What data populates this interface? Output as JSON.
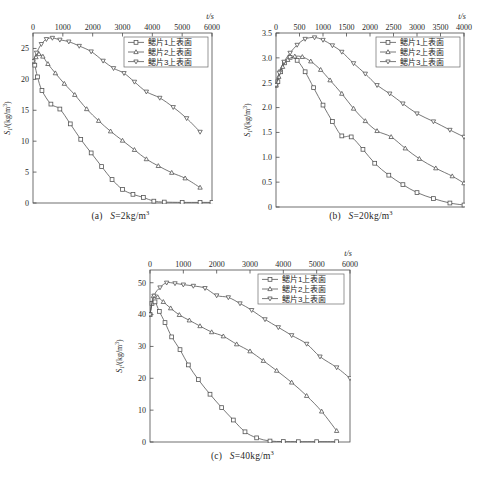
{
  "figure": {
    "series_names": [
      "鳃片1上表面",
      "鳃片2上表面",
      "鳃片3上表面"
    ],
    "markers": [
      "square",
      "triangle-up",
      "triangle-down"
    ],
    "axis_title_x": "t/s",
    "curve_color": "#555555",
    "axis_color": "#4d4d4d"
  },
  "panels": [
    {
      "key": "a",
      "caption_prefix": "(a)",
      "caption_var": "S",
      "caption_eq": "=2kg/m",
      "caption_sup": "3",
      "caption_full": "(a)  S=2kg/m3",
      "ylabel_main": "S",
      "ylabel_sub": "1",
      "ylabel_unit": "/(kg/m",
      "ylabel_unit_sup": "3",
      "ylabel_unit_end": ")",
      "xlabel": "t/s",
      "xticks": [
        0,
        1000,
        2000,
        3000,
        4000,
        5000,
        6000
      ],
      "yticks": [
        0,
        5,
        10,
        15,
        20,
        25
      ],
      "xlim": [
        0,
        6000
      ],
      "ylim": [
        0,
        27.5
      ]
    },
    {
      "key": "b",
      "caption_prefix": "(b)",
      "caption_var": "S",
      "caption_eq": "=20kg/m",
      "caption_sup": "3",
      "caption_full": "(b)  S=20kg/m3",
      "ylabel_main": "S",
      "ylabel_sub": "1",
      "ylabel_unit": "/(kg/m",
      "ylabel_unit_sup": "3",
      "ylabel_unit_end": ")",
      "xlabel": "t/s",
      "xticks": [
        0,
        500,
        1000,
        1500,
        2000,
        2500,
        3000,
        3500,
        4000
      ],
      "yticks": [
        0,
        0.5,
        1.0,
        1.5,
        2.0,
        2.5,
        3.0,
        3.5
      ],
      "ytick_labels": [
        "0",
        "0.5",
        "1.0",
        "1.5",
        "2.0",
        "2.5",
        "3.0",
        "3.5"
      ],
      "xlim": [
        0,
        4000
      ],
      "ylim": [
        0,
        3.5
      ]
    },
    {
      "key": "c",
      "caption_prefix": "(c)",
      "caption_var": "S",
      "caption_eq": "=40kg/m",
      "caption_sup": "3",
      "caption_full": "(c)  S=40kg/m3",
      "ylabel_main": "S",
      "ylabel_sub": "1",
      "ylabel_unit": "/(kg/m",
      "ylabel_unit_sup": "3",
      "ylabel_unit_end": ")",
      "xlabel": "t/s",
      "xticks": [
        0,
        1000,
        2000,
        3000,
        4000,
        5000,
        6000
      ],
      "yticks": [
        0,
        10,
        20,
        30,
        40,
        50
      ],
      "xlim": [
        0,
        6000
      ],
      "ylim": [
        0,
        54
      ]
    }
  ],
  "chart_data": [
    {
      "type": "line",
      "title": "(a) S=2kg/m3",
      "xlabel": "t/s",
      "ylabel": "S1/(kg/m3)",
      "xlim": [
        0,
        6000
      ],
      "ylim": [
        0,
        27.5
      ],
      "xticks": [
        0,
        1000,
        2000,
        3000,
        4000,
        5000,
        6000
      ],
      "yticks": [
        0,
        5,
        10,
        15,
        20,
        25
      ],
      "grid": false,
      "legend_position": "top-right",
      "series": [
        {
          "name": "鳃片1上表面",
          "marker": "square",
          "x": [
            0,
            60,
            150,
            300,
            600,
            900,
            1250,
            1600,
            1950,
            2300,
            2650,
            3000,
            3350,
            3700,
            4050,
            4400,
            5000,
            5600,
            6000
          ],
          "y": [
            22.8,
            22.3,
            20.4,
            18.2,
            16.0,
            15.2,
            12.8,
            10.3,
            8.1,
            5.9,
            3.8,
            2.2,
            1.4,
            0.9,
            0.3,
            0.15,
            0.1,
            0.1,
            0.1
          ]
        },
        {
          "name": "鳃片2上表面",
          "marker": "triangle-up",
          "x": [
            0,
            100,
            200,
            330,
            500,
            750,
            1050,
            1400,
            1800,
            2200,
            2600,
            3000,
            3400,
            3800,
            4200,
            4650,
            5100,
            5600
          ],
          "y": [
            22.9,
            23.6,
            24.1,
            23.7,
            22.5,
            21.0,
            19.3,
            17.5,
            15.2,
            13.3,
            11.6,
            10.1,
            8.6,
            7.1,
            6.0,
            4.9,
            4.0,
            2.5
          ]
        },
        {
          "name": "鳃片3上表面",
          "marker": "triangle-down",
          "x": [
            0,
            120,
            280,
            450,
            650,
            900,
            1200,
            1550,
            1950,
            2350,
            2700,
            3050,
            3400,
            3800,
            4250,
            4700,
            5150,
            5600
          ],
          "y": [
            22.9,
            24.3,
            25.7,
            26.5,
            26.7,
            26.4,
            26.1,
            25.4,
            24.5,
            23.0,
            21.8,
            21.0,
            19.6,
            18.0,
            17.0,
            15.5,
            13.7,
            11.5
          ]
        }
      ]
    },
    {
      "type": "line",
      "title": "(b) S=20kg/m3",
      "xlabel": "t/s",
      "ylabel": "S1/(kg/m3)",
      "xlim": [
        0,
        4000
      ],
      "ylim": [
        0,
        3.5
      ],
      "xticks": [
        0,
        500,
        1000,
        1500,
        2000,
        2500,
        3000,
        3500,
        4000
      ],
      "yticks": [
        0,
        0.5,
        1.0,
        1.5,
        2.0,
        2.5,
        3.0,
        3.5
      ],
      "grid": false,
      "legend_position": "top-right",
      "series": [
        {
          "name": "鳃片1上表面",
          "marker": "square",
          "x": [
            0,
            40,
            100,
            180,
            300,
            450,
            620,
            800,
            1000,
            1200,
            1400,
            1600,
            1850,
            2100,
            2400,
            2700,
            3000,
            3350,
            3700,
            4000
          ],
          "y": [
            2.45,
            2.52,
            2.72,
            2.9,
            3.01,
            2.95,
            2.72,
            2.4,
            2.05,
            1.72,
            1.43,
            1.41,
            1.16,
            0.88,
            0.64,
            0.45,
            0.29,
            0.17,
            0.08,
            0.04
          ]
        },
        {
          "name": "鳃片2上表面",
          "marker": "triangle-up",
          "x": [
            0,
            60,
            140,
            250,
            400,
            560,
            740,
            950,
            1150,
            1400,
            1650,
            1900,
            2150,
            2450,
            2750,
            3050,
            3400,
            3750,
            4000
          ],
          "y": [
            2.45,
            2.62,
            2.82,
            2.96,
            3.03,
            3.02,
            2.93,
            2.76,
            2.55,
            2.28,
            1.98,
            1.73,
            1.53,
            1.41,
            1.18,
            0.97,
            0.78,
            0.62,
            0.48
          ]
        },
        {
          "name": "鳃片3上表面",
          "marker": "triangle-down",
          "x": [
            0,
            70,
            170,
            300,
            450,
            620,
            820,
            1000,
            1200,
            1400,
            1650,
            1900,
            2150,
            2420,
            2700,
            3000,
            3350,
            3700,
            4000
          ],
          "y": [
            2.45,
            2.7,
            2.92,
            3.1,
            3.26,
            3.38,
            3.41,
            3.36,
            3.25,
            3.12,
            2.89,
            2.68,
            2.45,
            2.28,
            2.08,
            1.88,
            1.72,
            1.55,
            1.41
          ]
        }
      ]
    },
    {
      "type": "line",
      "title": "(c) S=40kg/m3",
      "xlabel": "t/s",
      "ylabel": "S1/(kg/m3)",
      "xlim": [
        0,
        6000
      ],
      "ylim": [
        0,
        54
      ],
      "xticks": [
        0,
        1000,
        2000,
        3000,
        4000,
        5000,
        6000
      ],
      "yticks": [
        0,
        10,
        20,
        30,
        40,
        50
      ],
      "grid": false,
      "legend_position": "top-right",
      "series": [
        {
          "name": "鳃片1上表面",
          "marker": "square",
          "x": [
            0,
            60,
            150,
            280,
            450,
            650,
            900,
            1150,
            1450,
            1800,
            2150,
            2500,
            2850,
            3200,
            3600,
            4000,
            4450,
            5000,
            5600
          ],
          "y": [
            40.0,
            43.5,
            44.0,
            41.0,
            37.5,
            33.0,
            29.0,
            24.2,
            19.6,
            15.0,
            10.8,
            6.9,
            3.2,
            1.3,
            0.3,
            0.15,
            0.1,
            0.1,
            0.1
          ]
        },
        {
          "name": "鳃片2上表面",
          "marker": "triangle-up",
          "x": [
            0,
            100,
            230,
            400,
            620,
            880,
            1180,
            1500,
            1850,
            2200,
            2600,
            3000,
            3400,
            3800,
            4250,
            4700,
            5150,
            5600
          ],
          "y": [
            40.0,
            45.8,
            45.5,
            44.0,
            42.0,
            39.9,
            38.2,
            36.4,
            34.5,
            33.2,
            30.7,
            28.5,
            25.5,
            22.4,
            18.7,
            14.5,
            9.6,
            3.5
          ]
        },
        {
          "name": "鳃片3上表面",
          "marker": "triangle-down",
          "x": [
            0,
            120,
            300,
            500,
            750,
            1000,
            1300,
            1650,
            2000,
            2350,
            2700,
            3050,
            3450,
            3850,
            4250,
            4700,
            5100,
            5600,
            6000
          ],
          "y": [
            40.0,
            45.9,
            48.5,
            50.0,
            49.8,
            49.4,
            49.0,
            48.3,
            46.0,
            45.4,
            43.5,
            41.4,
            38.5,
            36.0,
            33.5,
            30.8,
            26.8,
            23.4,
            20.0
          ]
        }
      ]
    }
  ]
}
